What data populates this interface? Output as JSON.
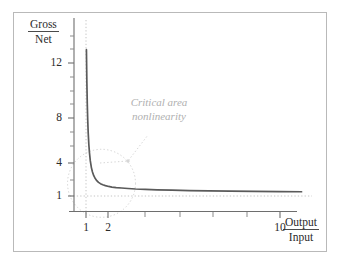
{
  "chart_data": {
    "type": "line",
    "title": "",
    "subtitle": "",
    "xlabel_numerator": "Output",
    "xlabel_denominator": "Input",
    "ylabel_numerator": "Gross",
    "ylabel_denominator": "Net",
    "xlim": [
      0.55,
      12.2
    ],
    "ylim": [
      0,
      14.8
    ],
    "grid": false,
    "legend": null,
    "x_tick_labels": [
      "1",
      "2",
      "10"
    ],
    "x_tick_values": [
      1,
      2,
      10
    ],
    "x_minor_tick_values": [
      3.6,
      5.4,
      7.2,
      9.0
    ],
    "y_tick_labels": [
      "1",
      "4",
      "8",
      "12"
    ],
    "y_tick_values": [
      1,
      4,
      8,
      12
    ],
    "y_minor_tick_values": [
      2.5,
      5.5,
      6.8,
      9.3,
      10.7,
      13.2
    ],
    "reference_lines": [
      {
        "name": "vertical-asymptote",
        "orientation": "vertical",
        "value": 1,
        "style": "dotted"
      },
      {
        "name": "horizontal-asymptote",
        "orientation": "horizontal",
        "value": 1,
        "style": "dotted"
      }
    ],
    "series": [
      {
        "name": "gross-to-net-ratio",
        "color": "#5a5a5a",
        "x": [
          1.02,
          1.04,
          1.06,
          1.08,
          1.1,
          1.13,
          1.16,
          1.2,
          1.25,
          1.3,
          1.36,
          1.43,
          1.5,
          1.58,
          1.67,
          1.78,
          1.9,
          2.05,
          2.2,
          2.4,
          2.65,
          2.95,
          3.3,
          3.75,
          4.3,
          5.0,
          5.8,
          6.7,
          7.7,
          8.8,
          10.0,
          11.0
        ],
        "y": [
          13.1,
          10.4,
          8.6,
          7.3,
          6.3,
          5.3,
          4.6,
          3.9,
          3.35,
          2.98,
          2.68,
          2.44,
          2.27,
          2.13,
          2.02,
          1.93,
          1.86,
          1.79,
          1.74,
          1.7,
          1.66,
          1.62,
          1.58,
          1.55,
          1.51,
          1.48,
          1.45,
          1.42,
          1.4,
          1.38,
          1.36,
          1.35
        ]
      }
    ],
    "annotations": [
      {
        "name": "critical-area-callout",
        "text": "Critical area\nnonlinearity",
        "color": "#b0b0b0",
        "highlight_shape": "circle",
        "highlight_center": [
          1.72,
          2.05
        ],
        "highlight_radius_px": 34,
        "leader_line": true
      }
    ],
    "colors": {
      "curve": "#5a5a5a",
      "axis": "#6e6e6e",
      "dotted": "#c4c4c4",
      "annotation": "#b0b0b0",
      "frame": "#b9b9b9",
      "text": "#2b2b2b",
      "background": "#ffffff"
    }
  }
}
